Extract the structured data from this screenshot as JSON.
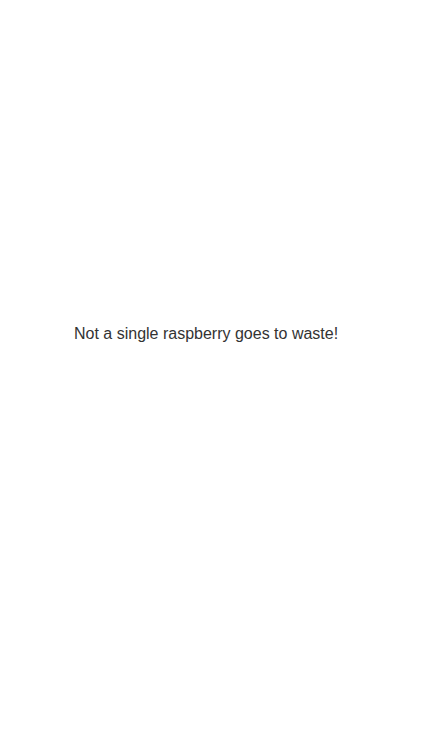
{
  "main": {
    "message": "Not a single raspberry goes to waste!"
  },
  "colors": {
    "background": "#ffffff",
    "text": "#333333"
  }
}
